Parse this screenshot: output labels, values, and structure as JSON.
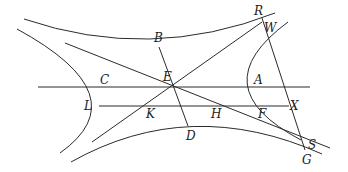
{
  "diagram": {
    "type": "conic-hyperbola-construction",
    "colors": {
      "stroke": "#2b2b2b",
      "text": "#222222",
      "background": "#ffffff"
    },
    "points": [
      {
        "id": "R",
        "label": "R",
        "x": 254,
        "y": 15
      },
      {
        "id": "W",
        "label": "W",
        "x": 264,
        "y": 32
      },
      {
        "id": "B",
        "label": "B",
        "x": 154,
        "y": 42
      },
      {
        "id": "C",
        "label": "C",
        "x": 100,
        "y": 84
      },
      {
        "id": "E",
        "label": "E",
        "x": 163,
        "y": 81
      },
      {
        "id": "A",
        "label": "A",
        "x": 254,
        "y": 84
      },
      {
        "id": "L",
        "label": "L",
        "x": 84,
        "y": 110
      },
      {
        "id": "K",
        "label": "K",
        "x": 146,
        "y": 118
      },
      {
        "id": "H",
        "label": "H",
        "x": 211,
        "y": 118
      },
      {
        "id": "F",
        "label": "F",
        "x": 258,
        "y": 118
      },
      {
        "id": "X",
        "label": "X",
        "x": 290,
        "y": 110
      },
      {
        "id": "D",
        "label": "D",
        "x": 186,
        "y": 140
      },
      {
        "id": "S",
        "label": "S",
        "x": 308,
        "y": 149
      },
      {
        "id": "G",
        "label": "G",
        "x": 302,
        "y": 164
      }
    ],
    "segments": [
      {
        "id": "axis-CA",
        "from": [
          38,
          87
        ],
        "to": [
          310,
          87
        ]
      },
      {
        "id": "chord-LX",
        "from": [
          99,
          106
        ],
        "to": [
          289,
          106
        ]
      },
      {
        "id": "asymptote-1",
        "from": [
          65,
          43
        ],
        "to": [
          330,
          148
        ]
      },
      {
        "id": "asymptote-2",
        "from": [
          92,
          142
        ],
        "to": [
          262,
          22
        ]
      },
      {
        "id": "line-BD",
        "from": [
          159,
          47
        ],
        "to": [
          188,
          126
        ]
      },
      {
        "id": "line-RG",
        "from": [
          262,
          18
        ],
        "to": [
          305,
          150
        ]
      }
    ],
    "curves": [
      {
        "id": "upper-branch",
        "d": "M24,19 Q150,62 275,13"
      },
      {
        "id": "lower-branch",
        "d": "M71,162 Q190,95 322,154"
      },
      {
        "id": "left-branch",
        "d": "M17,29 Q140,96 60,153"
      },
      {
        "id": "right-branch",
        "d": "M288,22 Q200,87 301,140"
      }
    ]
  }
}
